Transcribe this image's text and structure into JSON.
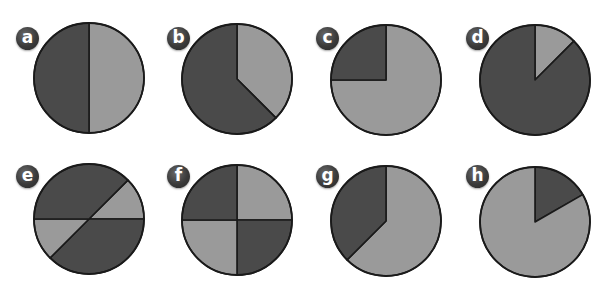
{
  "colors": {
    "dark": "#4a4a4a",
    "light": "#9a9a9a",
    "stroke": "#1a1a1a"
  },
  "chart_data": [
    {
      "type": "pie",
      "label": "a",
      "slices": [
        {
          "name": "light",
          "value": 50,
          "color": "#9a9a9a"
        },
        {
          "name": "dark",
          "value": 50,
          "color": "#4a4a4a"
        }
      ]
    },
    {
      "type": "pie",
      "label": "b",
      "slices": [
        {
          "name": "light",
          "value": 37.5,
          "color": "#9a9a9a"
        },
        {
          "name": "dark",
          "value": 62.5,
          "color": "#4a4a4a"
        }
      ]
    },
    {
      "type": "pie",
      "label": "c",
      "slices": [
        {
          "name": "light",
          "value": 75,
          "color": "#9a9a9a"
        },
        {
          "name": "dark",
          "value": 25,
          "color": "#4a4a4a"
        }
      ]
    },
    {
      "type": "pie",
      "label": "d",
      "slices": [
        {
          "name": "light",
          "value": 12.5,
          "color": "#9a9a9a"
        },
        {
          "name": "dark",
          "value": 87.5,
          "color": "#4a4a4a"
        }
      ]
    },
    {
      "type": "pie",
      "label": "e",
      "slices": [
        {
          "name": "light-upper-right",
          "value": 12.5,
          "color": "#9a9a9a"
        },
        {
          "name": "dark-upper",
          "value": 37.5,
          "color": "#4a4a4a"
        },
        {
          "name": "light-lower-left",
          "value": 12.5,
          "color": "#9a9a9a"
        },
        {
          "name": "dark-lower",
          "value": 37.5,
          "color": "#4a4a4a"
        }
      ]
    },
    {
      "type": "pie",
      "label": "f",
      "slices": [
        {
          "name": "light-top-right",
          "value": 25,
          "color": "#9a9a9a"
        },
        {
          "name": "dark-bottom-right",
          "value": 25,
          "color": "#4a4a4a"
        },
        {
          "name": "light-bottom-left",
          "value": 25,
          "color": "#9a9a9a"
        },
        {
          "name": "dark-top-left",
          "value": 25,
          "color": "#4a4a4a"
        }
      ]
    },
    {
      "type": "pie",
      "label": "g",
      "slices": [
        {
          "name": "light",
          "value": 62.5,
          "color": "#9a9a9a"
        },
        {
          "name": "dark",
          "value": 37.5,
          "color": "#4a4a4a"
        }
      ]
    },
    {
      "type": "pie",
      "label": "h",
      "slices": [
        {
          "name": "dark",
          "value": 16.7,
          "color": "#4a4a4a"
        },
        {
          "name": "light",
          "value": 83.3,
          "color": "#9a9a9a"
        }
      ]
    }
  ],
  "layout": [
    {
      "badge": [
        16,
        27
      ],
      "cx": 89,
      "cy": 78,
      "r": 55
    },
    {
      "badge": [
        167,
        27
      ],
      "cx": 237,
      "cy": 79,
      "r": 55
    },
    {
      "badge": [
        316,
        27
      ],
      "cx": 386,
      "cy": 80,
      "r": 55
    },
    {
      "badge": [
        466,
        27
      ],
      "cx": 535,
      "cy": 80,
      "r": 55
    },
    {
      "badge": [
        16,
        165
      ],
      "cx": 89,
      "cy": 219,
      "r": 55
    },
    {
      "badge": [
        167,
        165
      ],
      "cx": 237,
      "cy": 220,
      "r": 55
    },
    {
      "badge": [
        316,
        165
      ],
      "cx": 386,
      "cy": 221,
      "r": 55
    },
    {
      "badge": [
        466,
        165
      ],
      "cx": 535,
      "cy": 222,
      "r": 55
    }
  ]
}
